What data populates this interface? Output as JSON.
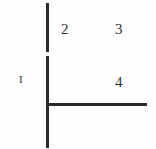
{
  "figure": {
    "background_color": "#fefefe",
    "ink_color": "#2b2b2b",
    "width": 156,
    "height": 149,
    "strokes": {
      "vertical_upper": {
        "x": 46,
        "y": 3,
        "length": 49,
        "orientation": "vertical"
      },
      "vertical_lower": {
        "x": 46,
        "y": 56,
        "length": 93,
        "orientation": "vertical"
      },
      "horizontal": {
        "x": 46,
        "y": 103,
        "length": 101,
        "orientation": "horizontal"
      }
    },
    "labels": [
      {
        "id": "label-2",
        "text": "2",
        "x": 61,
        "y": 22,
        "kind": "numeral"
      },
      {
        "id": "label-3",
        "text": "3",
        "x": 115,
        "y": 22,
        "kind": "numeral"
      },
      {
        "id": "label-1",
        "text": "I",
        "x": 19,
        "y": 74,
        "kind": "roman-numeral"
      },
      {
        "id": "label-4",
        "text": "4",
        "x": 115,
        "y": 75,
        "kind": "numeral"
      }
    ]
  }
}
